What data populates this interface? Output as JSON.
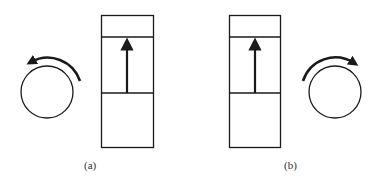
{
  "figure": {
    "colors": {
      "stroke": "#1a1a1a",
      "background": "#ffffff",
      "label": "#333333"
    },
    "panels": [
      {
        "id": "a",
        "label": "(a)",
        "rotation_direction": "counterclockwise",
        "piston_arrow_direction": "up",
        "circle_position": "left"
      },
      {
        "id": "b",
        "label": "(b)",
        "rotation_direction": "clockwise",
        "piston_arrow_direction": "up",
        "circle_position": "right"
      }
    ]
  }
}
